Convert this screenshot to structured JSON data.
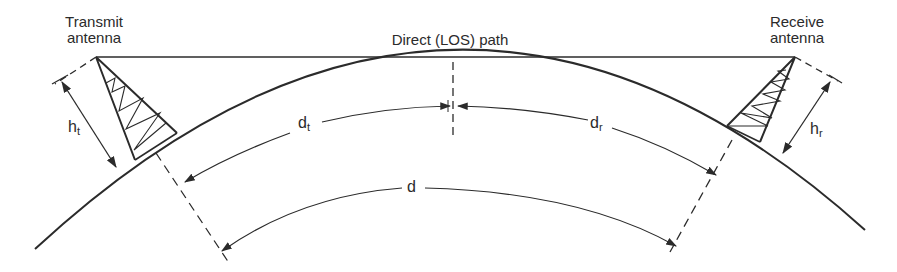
{
  "colors": {
    "ink": "#2b2b2b",
    "background": "#ffffff"
  },
  "labels": {
    "transmit_line1": "Transmit",
    "transmit_line2": "antenna",
    "receive_line1": "Receive",
    "receive_line2": "antenna",
    "los_path": "Direct (LOS) path",
    "ht_main": "h",
    "ht_sub": "t",
    "hr_main": "h",
    "hr_sub": "r",
    "dt_main": "d",
    "dt_sub": "t",
    "dr_main": "d",
    "dr_sub": "r",
    "d": "d"
  },
  "elements": [
    "earth-surface-arc",
    "transmit-antenna-tower",
    "receive-antenna-tower",
    "los-path-line",
    "transmit-height-dimension",
    "receive-height-dimension",
    "dt-distance-arrow",
    "dr-distance-arrow",
    "total-distance-arrow",
    "horizon-tangent-dashed-line"
  ]
}
